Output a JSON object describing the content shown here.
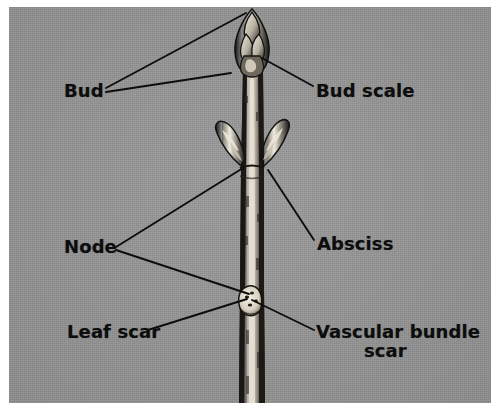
{
  "figure": {
    "background_color": "#979797",
    "ink_color": "#0d0d0d",
    "frame_color": "#ffffff"
  },
  "labels": [
    {
      "id": "bud",
      "text": "Bud",
      "x": 64,
      "y": 80
    },
    {
      "id": "bud-scale",
      "text": "Bud scale",
      "x": 316,
      "y": 80
    },
    {
      "id": "node",
      "text": "Node",
      "x": 64,
      "y": 236
    },
    {
      "id": "absciss",
      "text": "Absciss",
      "x": 317,
      "y": 233
    },
    {
      "id": "leaf-scar",
      "text": "Leaf scar",
      "x": 67,
      "y": 321
    },
    {
      "id": "vascular-line1",
      "text": "Vascular bundle",
      "x": 316,
      "y": 321
    },
    {
      "id": "vascular-line2",
      "text": "scar",
      "x": 364,
      "y": 340
    }
  ],
  "leader_lines": [
    {
      "id": "bud-to-terminal-bud",
      "from": [
        106,
        88
      ],
      "to": [
        246,
        13
      ]
    },
    {
      "id": "bud-to-lateral-bud",
      "from": [
        106,
        92
      ],
      "to": [
        231,
        73
      ]
    },
    {
      "id": "bud-scale-to-scale",
      "from": [
        313,
        86
      ],
      "to": [
        262,
        58
      ]
    },
    {
      "id": "node-to-upper-node",
      "from": [
        116,
        247
      ],
      "to": [
        243,
        168
      ]
    },
    {
      "id": "node-to-lower-node",
      "from": [
        116,
        250
      ],
      "to": [
        249,
        294
      ]
    },
    {
      "id": "absciss-to-bud-base",
      "from": [
        314,
        240
      ],
      "to": [
        268,
        170
      ]
    },
    {
      "id": "leaf-scar-to-scar",
      "from": [
        148,
        330
      ],
      "to": [
        247,
        299
      ]
    },
    {
      "id": "vascular-to-scar",
      "from": [
        314,
        330
      ],
      "to": [
        252,
        300
      ]
    }
  ],
  "twig_parts": [
    {
      "id": "terminal-bud",
      "description": "pointed terminal bud with overlapping scales"
    },
    {
      "id": "bud-scale",
      "description": "outer scale of terminal bud"
    },
    {
      "id": "lateral-bud-left",
      "description": "lateral bud angled up-left at node"
    },
    {
      "id": "lateral-bud-right",
      "description": "lateral bud angled up-right at node"
    },
    {
      "id": "stem",
      "description": "vertical woody twig"
    },
    {
      "id": "leaf-scar",
      "description": "crescent leaf scar with vascular bundle scars"
    }
  ]
}
